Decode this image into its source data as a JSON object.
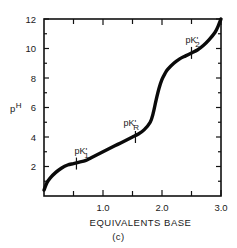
{
  "chart_data": {
    "type": "line",
    "title": "",
    "caption": "(c)",
    "xlabel": "EQUIVALENTS BASE",
    "ylabel": "pH",
    "ylabel_parts": {
      "main": "p",
      "sup": "H"
    },
    "xlim": [
      0,
      3.0
    ],
    "ylim": [
      0,
      12
    ],
    "grid": false,
    "legend": null,
    "x_tick_labels": [
      "1.0",
      "2.0",
      "3.0"
    ],
    "x_ticks": [
      0.5,
      1.0,
      1.5,
      2.0,
      2.5,
      3.0
    ],
    "y_tick_labels": [
      "2",
      "4",
      "6",
      "8",
      "10",
      "12"
    ],
    "y_ticks": [
      1,
      2,
      3,
      4,
      5,
      6,
      7,
      8,
      9,
      10,
      11,
      12
    ],
    "series": [
      {
        "name": "titration curve",
        "x": [
          0.0,
          0.05,
          0.1,
          0.2,
          0.3,
          0.4,
          0.5,
          0.6,
          0.7,
          0.8,
          0.9,
          1.0,
          1.1,
          1.2,
          1.3,
          1.4,
          1.5,
          1.6,
          1.7,
          1.8,
          1.85,
          1.9,
          1.95,
          2.0,
          2.05,
          2.1,
          2.2,
          2.3,
          2.4,
          2.5,
          2.6,
          2.7,
          2.8,
          2.9,
          2.95,
          3.0
        ],
        "y": [
          0.4,
          0.9,
          1.2,
          1.6,
          1.9,
          2.1,
          2.2,
          2.3,
          2.4,
          2.6,
          2.8,
          3.0,
          3.2,
          3.4,
          3.6,
          3.8,
          4.0,
          4.2,
          4.5,
          5.0,
          5.6,
          6.5,
          7.3,
          7.9,
          8.3,
          8.6,
          9.0,
          9.3,
          9.5,
          9.7,
          9.9,
          10.2,
          10.6,
          11.1,
          11.5,
          12.0
        ]
      }
    ],
    "annotations": [
      {
        "text": "pK'",
        "sub": "1",
        "x": 0.55,
        "y": 2.2
      },
      {
        "text": "pK'",
        "sub": "R",
        "x": 1.55,
        "y": 4.0
      },
      {
        "text": "pK'",
        "sub": "2",
        "x": 2.5,
        "y": 9.7
      }
    ]
  }
}
